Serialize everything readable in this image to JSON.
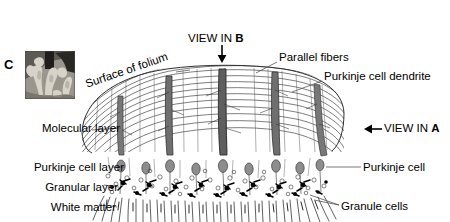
{
  "figure": {
    "panel_letter": "C",
    "background_color": "#ffffff",
    "ink_color": "#000000",
    "shading_color": "#7a7a7a"
  },
  "inset": {
    "name": "cerebellar-folia-photograph",
    "description": "grayscale photomicrograph of cerebellar folia",
    "background_color": "#8a8a8a",
    "tissue_color": "#cfcac2",
    "shadow_color": "#2b2b2b"
  },
  "labels": {
    "view_in_b": {
      "text": "VIEW IN ",
      "bold": "B",
      "arrow": "down-arrow-icon"
    },
    "view_in_a": {
      "text": "VIEW IN ",
      "bold": "A",
      "arrow": "left-arrow-icon"
    },
    "surface_of_folium": "Surface of folium",
    "parallel_fibers": "Parallel fibers",
    "purkinje_cell_dendrite": "Purkinje cell dendrite",
    "purkinje_cell": "Purkinje cell",
    "granule_cells": "Granule cells",
    "molecular_layer": "Molecular layer",
    "purkinje_cell_layer": "Purkinje cell layer",
    "granular_layer": "Granular layer",
    "white_matter": "White matter"
  },
  "layers": [
    {
      "name": "molecular layer",
      "order": 1,
      "contents": "parallel fibers, Purkinje dendritic trees"
    },
    {
      "name": "Purkinje cell layer",
      "order": 2,
      "contents": "Purkinje cell somata"
    },
    {
      "name": "granular layer",
      "order": 3,
      "contents": "granule cells, glomeruli"
    },
    {
      "name": "white matter",
      "order": 4,
      "contents": "afferent and efferent axons"
    }
  ]
}
